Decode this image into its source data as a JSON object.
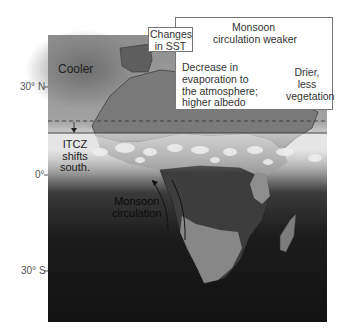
{
  "figure": {
    "title": "",
    "latitude_ticks": [
      {
        "label": "30° N",
        "y": 87
      },
      {
        "label": "0°",
        "y": 175
      },
      {
        "label": "30° S",
        "y": 271
      }
    ],
    "labels": {
      "cooler": "Cooler",
      "itcz": [
        "ITCZ",
        "shifts",
        "south."
      ],
      "monsoon_map": [
        "Monsoon",
        "circulation"
      ]
    },
    "sst_box": {
      "lines": [
        "Changes",
        "in SST"
      ]
    },
    "feedback_box": {
      "top": [
        "Monsoon",
        "circulation weaker"
      ],
      "right": [
        "Drier,",
        "less",
        "vegetation"
      ],
      "left": [
        "Decrease in",
        "evaporation to",
        "the atmosphere;",
        "higher albedo"
      ]
    },
    "lines": {
      "dashed_former_itcz_y": 121,
      "solid_new_itcz_y": 133
    },
    "colors": {
      "ocean_north": "#9a9a9a",
      "ocean_south": "#151515",
      "land_north": "#7d7d7d",
      "land_south_dark": "#3a3a3a",
      "land_south_light": "#858585",
      "cloud_band": "#e6e6e6",
      "box_border": "#777777"
    }
  }
}
